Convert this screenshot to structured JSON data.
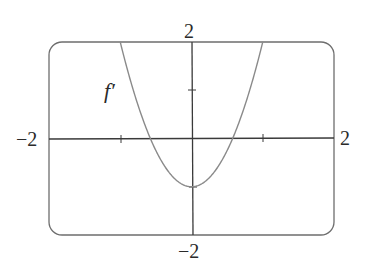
{
  "chart_data": {
    "type": "line",
    "title": "",
    "xlabel": "",
    "ylabel": "",
    "xlim": [
      -2,
      2
    ],
    "ylim": [
      -2,
      2
    ],
    "grid": false,
    "legend": null,
    "annotations": [
      {
        "text": "f′",
        "x": -0.95,
        "y": 1.15
      }
    ],
    "tick_labels": {
      "x_min": "−2",
      "x_max": "2",
      "y_min": "−2",
      "y_max": "2"
    },
    "x_ticks": [
      -1,
      1
    ],
    "y_ticks": [
      1
    ],
    "series": [
      {
        "name": "f′",
        "formula": "3x^2 - 1",
        "x": [
          -1.0,
          -0.8,
          -0.577,
          -0.4,
          -0.2,
          0.0,
          0.2,
          0.4,
          0.577,
          0.8,
          1.0
        ],
        "y": [
          2.0,
          0.92,
          0.0,
          -0.52,
          -0.88,
          -1.0,
          -0.88,
          -0.52,
          0.0,
          0.92,
          2.0
        ]
      }
    ],
    "key_points": {
      "minimum": [
        0,
        -1
      ],
      "roots": [
        -0.577,
        0.577
      ]
    }
  },
  "labels": {
    "x_min": "−2",
    "x_max": "2",
    "y_min": "−2",
    "y_max": "2",
    "curve": "f′"
  },
  "colors": {
    "frame": "#6e6e6e",
    "axis": "#3a3a3a",
    "curve": "#8a8a8a",
    "text": "#2a2a2a"
  }
}
